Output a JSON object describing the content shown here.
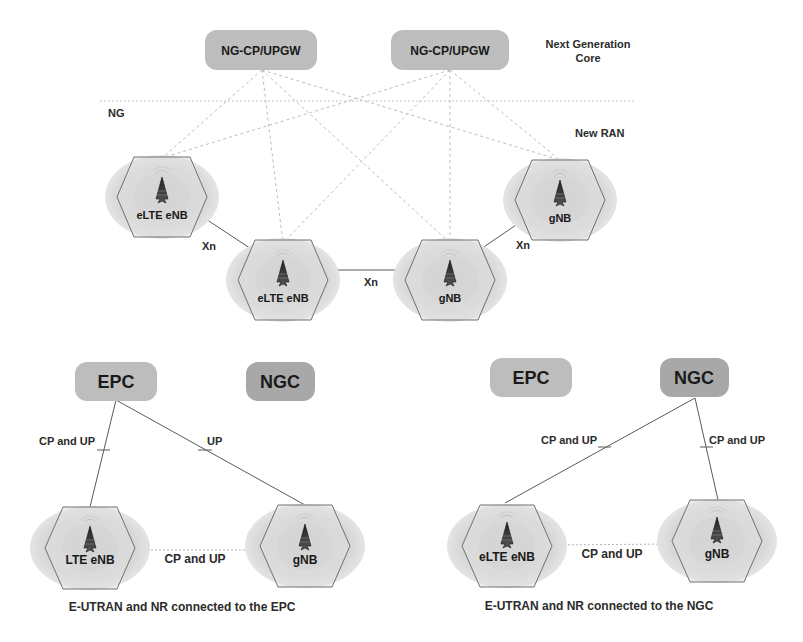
{
  "colors": {
    "background": "#ffffff",
    "core_box": "#bdbdbd",
    "core_box_dark": "#a8a8a8",
    "cell_halo": "#d6d6d6",
    "hexagon_fill": "#e2e2e2",
    "hexagon_stroke": "#6e6e6e",
    "link_solid": "#5a5a5a",
    "link_dashed": "#b5b5b5",
    "text": "#2b2b2b"
  },
  "top_diagram": {
    "core_nodes": [
      {
        "label": "NG-CP/UPGW"
      },
      {
        "label": "NG-CP/UPGW"
      }
    ],
    "core_label_line1": "Next Generation",
    "core_label_line2": "Core",
    "interface_label": "NG",
    "ran_label": "New RAN",
    "ran_nodes": [
      {
        "label": "eLTE eNB",
        "icon": "antenna-tower-icon"
      },
      {
        "label": "eLTE eNB",
        "icon": "antenna-tower-icon"
      },
      {
        "label": "gNB",
        "icon": "antenna-tower-icon"
      },
      {
        "label": "gNB",
        "icon": "antenna-tower-icon"
      }
    ],
    "xn_labels": [
      "Xn",
      "Xn",
      "Xn"
    ]
  },
  "bottom_left_diagram": {
    "core_nodes": [
      {
        "label": "EPC"
      },
      {
        "label": "NGC"
      }
    ],
    "links": [
      {
        "label": "CP and UP"
      },
      {
        "label": "UP"
      }
    ],
    "ran_nodes": [
      {
        "label": "LTE eNB",
        "icon": "antenna-tower-icon"
      },
      {
        "label": "gNB",
        "icon": "antenna-tower-icon"
      }
    ],
    "ran_link_label": "CP and UP",
    "caption": "E-UTRAN and NR connected to the EPC"
  },
  "bottom_right_diagram": {
    "core_nodes": [
      {
        "label": "EPC"
      },
      {
        "label": "NGC"
      }
    ],
    "links": [
      {
        "label": "CP and UP"
      },
      {
        "label": "CP and UP"
      }
    ],
    "ran_nodes": [
      {
        "label": "eLTE eNB",
        "icon": "antenna-tower-icon"
      },
      {
        "label": "gNB",
        "icon": "antenna-tower-icon"
      }
    ],
    "ran_link_label": "CP and UP",
    "caption": "E-UTRAN and NR connected to the NGC"
  }
}
